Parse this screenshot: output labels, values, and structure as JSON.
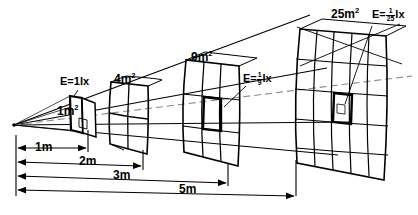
{
  "diagram": {
    "colors": {
      "ink": "#000000",
      "background": "#ffffff",
      "dashed": "#8a8a8a"
    },
    "source": {
      "name": "point-light-source",
      "distance": "0m"
    },
    "areas": [
      {
        "id": "a1",
        "label": "1m",
        "exponent": "2",
        "grid": 1,
        "distance": "1m"
      },
      {
        "id": "a4",
        "label": "4m",
        "exponent": "2",
        "grid": 2,
        "distance": "2m"
      },
      {
        "id": "a9",
        "label": "9m",
        "exponent": "2",
        "grid": 3,
        "distance": "3m"
      },
      {
        "id": "a25",
        "label": "25m",
        "exponent": "2",
        "grid": 5,
        "distance": "5m"
      }
    ],
    "illuminance": [
      {
        "id": "e1",
        "prefix": "E=1lx",
        "numerator": "",
        "denominator": "",
        "suffix": ""
      },
      {
        "id": "e9",
        "prefix": "E=",
        "numerator": "1",
        "denominator": "9",
        "suffix": "lx"
      },
      {
        "id": "e25",
        "prefix": "E=",
        "numerator": "1",
        "denominator": "25",
        "suffix": "lx"
      }
    ],
    "dimensions": [
      {
        "id": "d1",
        "label": "1m"
      },
      {
        "id": "d2",
        "label": "2m"
      },
      {
        "id": "d3",
        "label": "3m"
      },
      {
        "id": "d5",
        "label": "5m"
      }
    ]
  }
}
